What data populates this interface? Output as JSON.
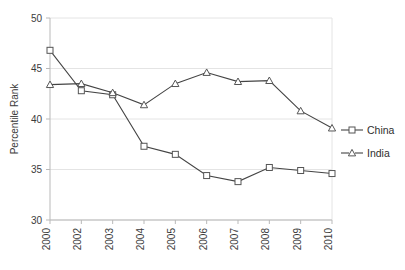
{
  "chart_data": {
    "type": "line",
    "title": "",
    "xlabel": "",
    "ylabel": "Percentile Rank",
    "categories": [
      "2000",
      "2002",
      "2003",
      "2004",
      "2005",
      "2006",
      "2007",
      "2008",
      "2009",
      "2010"
    ],
    "ylim": [
      30,
      50
    ],
    "yticks": [
      30,
      35,
      40,
      45,
      50
    ],
    "ytick_labels": [
      "30",
      "35",
      "40",
      "45",
      "50"
    ],
    "grid": true,
    "legend_position": "right",
    "series": [
      {
        "name": "China",
        "marker": "square",
        "color": "#444444",
        "values": [
          46.8,
          42.8,
          42.4,
          37.3,
          36.5,
          34.4,
          33.8,
          35.2,
          34.9,
          34.6
        ]
      },
      {
        "name": "India",
        "marker": "triangle",
        "color": "#444444",
        "values": [
          43.4,
          43.5,
          42.6,
          41.4,
          43.5,
          44.6,
          43.7,
          43.8,
          40.8,
          39.1
        ]
      }
    ]
  },
  "legend": {
    "items": [
      {
        "label": "China"
      },
      {
        "label": "India"
      }
    ]
  },
  "axis": {
    "y_title": "Percentile Rank"
  }
}
